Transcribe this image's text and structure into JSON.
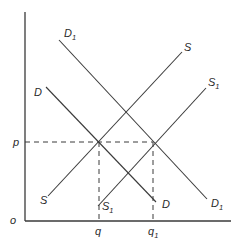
{
  "diagram": {
    "axes": {
      "origin_label": "o",
      "x_ticks": [
        {
          "label": "q",
          "sub": ""
        },
        {
          "label": "q",
          "sub": "1"
        }
      ],
      "y_ticks": [
        {
          "label": "p",
          "sub": ""
        }
      ]
    },
    "curves": {
      "D": {
        "label": "D",
        "sub": "",
        "lower_label": "D",
        "lower_sub": ""
      },
      "D1": {
        "label": "D",
        "sub": "1",
        "lower_label": "D",
        "lower_sub": "1"
      },
      "S": {
        "label": "S",
        "sub": "",
        "lower_label": "S",
        "lower_sub": ""
      },
      "S1": {
        "label": "S",
        "sub": "1",
        "lower_label": "S",
        "lower_sub": "1"
      }
    },
    "colors": {
      "line": "#3a3a3a",
      "background": "#ffffff"
    }
  }
}
